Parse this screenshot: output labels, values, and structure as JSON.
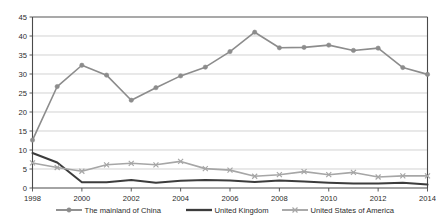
{
  "chart_data": {
    "type": "line",
    "title": "",
    "subtitle": "",
    "xlabel": "",
    "ylabel": "",
    "xlim": [
      1998,
      2014
    ],
    "ylim": [
      0,
      45
    ],
    "ytick_step": 5,
    "yticks": [
      0,
      5,
      10,
      15,
      20,
      25,
      30,
      35,
      40,
      45
    ],
    "xticks": [
      1998,
      2000,
      2002,
      2004,
      2006,
      2008,
      2010,
      2012,
      2014
    ],
    "x": [
      1998,
      1999,
      2000,
      2001,
      2002,
      2003,
      2004,
      2005,
      2006,
      2007,
      2008,
      2009,
      2010,
      2011,
      2012,
      2013,
      2014
    ],
    "grid": "horizontal",
    "legend_position": "bottom",
    "series": [
      {
        "name": "The mainland of China",
        "color": "#8c8c8c",
        "marker": "circle",
        "line_width": 1.6,
        "values": [
          12.6,
          26.7,
          32.3,
          29.7,
          23.1,
          26.4,
          29.5,
          31.8,
          35.9,
          41.0,
          36.9,
          37.0,
          37.6,
          36.2,
          36.8,
          31.7,
          29.9
        ]
      },
      {
        "name": "United Kingdom",
        "color": "#3c3c3c",
        "marker": "none",
        "line_width": 2.0,
        "values": [
          9.2,
          6.7,
          1.5,
          1.5,
          2.1,
          1.4,
          1.9,
          2.1,
          2.0,
          1.6,
          2.0,
          1.7,
          1.4,
          1.2,
          1.2,
          1.4,
          0.9
        ]
      },
      {
        "name": "United States of America",
        "color": "#a6a6a6",
        "marker": "cross",
        "line_width": 1.6,
        "values": [
          6.6,
          5.4,
          4.4,
          6.1,
          6.5,
          6.1,
          7.0,
          5.1,
          4.7,
          3.1,
          3.5,
          4.3,
          3.5,
          4.1,
          2.9,
          3.2,
          3.2
        ]
      }
    ]
  },
  "legend": {
    "items": [
      {
        "label": "The mainland of China"
      },
      {
        "label": "United Kingdom"
      },
      {
        "label": "United States of America"
      }
    ]
  },
  "axes": {
    "y_tick_labels": [
      "0",
      "5",
      "10",
      "15",
      "20",
      "25",
      "30",
      "35",
      "40",
      "45"
    ],
    "x_tick_labels": [
      "1998",
      "2000",
      "2002",
      "2004",
      "2006",
      "2008",
      "2010",
      "2012",
      "2014"
    ]
  },
  "colors": {
    "china": "#8c8c8c",
    "uk": "#3c3c3c",
    "usa": "#a6a6a6",
    "grid": "#bfbfbf",
    "axis": "#4a4a4a",
    "text": "#2b2b2b",
    "background": "#ffffff"
  }
}
